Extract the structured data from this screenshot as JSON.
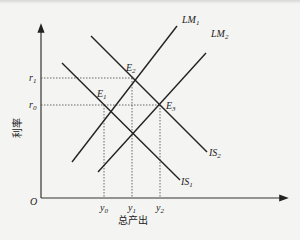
{
  "diagram": {
    "axes": {
      "x_label": "总产出",
      "y_label": "利率",
      "origin_label": "O"
    },
    "curves": [
      {
        "id": "LM1",
        "label": "LM",
        "sub": "1",
        "type": "upward"
      },
      {
        "id": "LM2",
        "label": "LM",
        "sub": "2",
        "type": "upward"
      },
      {
        "id": "IS1",
        "label": "IS",
        "sub": "1",
        "type": "downward"
      },
      {
        "id": "IS2",
        "label": "IS",
        "sub": "2",
        "type": "downward"
      }
    ],
    "equilibria": [
      {
        "id": "E1",
        "label": "E",
        "sub": "1",
        "intersection": "IS1 & LM1",
        "rate": "r0",
        "output": "y0"
      },
      {
        "id": "E2",
        "label": "E",
        "sub": "2",
        "intersection": "IS2 & LM1",
        "rate": "r1",
        "output": "y1"
      },
      {
        "id": "E3",
        "label": "E",
        "sub": "3",
        "intersection": "IS2 & LM2",
        "rate": "r0",
        "output": "y2"
      }
    ],
    "y_ticks": [
      {
        "label": "r",
        "sub": "1"
      },
      {
        "label": "r",
        "sub": "0"
      }
    ],
    "x_ticks": [
      {
        "label": "y",
        "sub": "0"
      },
      {
        "label": "y",
        "sub": "1"
      },
      {
        "label": "y",
        "sub": "2"
      }
    ]
  }
}
